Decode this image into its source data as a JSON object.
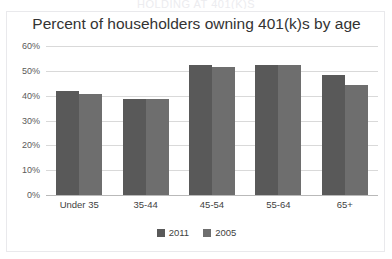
{
  "top_sliver": {
    "text": "HOLDING AT 401(K)S"
  },
  "chart_data": {
    "type": "bar",
    "title": "Percent of householders owning 401(k)s by age",
    "xlabel": "",
    "ylabel": "",
    "ylim": [
      0,
      60
    ],
    "ytick_labels": [
      "60%",
      "50%",
      "40%",
      "30%",
      "20%",
      "10%",
      "0%"
    ],
    "ytick_values": [
      60,
      50,
      40,
      30,
      20,
      10,
      0
    ],
    "grid": true,
    "legend_position": "bottom",
    "categories": [
      "Under 35",
      "35-44",
      "45-54",
      "55-64",
      "65+"
    ],
    "series": [
      {
        "name": "2011",
        "color": "#595959",
        "values": [
          42.0,
          38.7,
          52.5,
          52.2,
          48.5
        ]
      },
      {
        "name": "2005",
        "color": "#6e6e6e",
        "values": [
          40.8,
          38.7,
          51.4,
          52.2,
          44.3
        ]
      }
    ]
  },
  "colors": {
    "series_2011": "#595959",
    "series_2005": "#6e6e6e",
    "gridline": "#d9d9d9",
    "frame_border": "#e9e9ec",
    "background": "#ffffff",
    "title_text": "#333333",
    "tick_text": "#5a5a5a"
  }
}
